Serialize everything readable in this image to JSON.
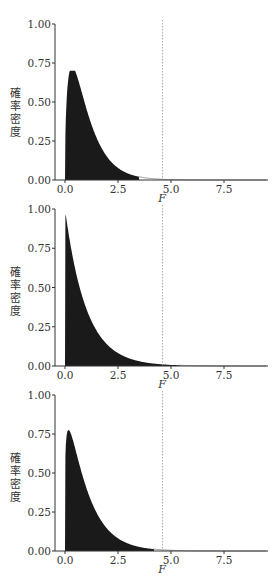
{
  "chart_data": [
    {
      "type": "area",
      "title": "",
      "xlabel": "F",
      "ylabel": "確率密度",
      "xlim": [
        0,
        9.5
      ],
      "ylim": [
        0,
        1.0
      ],
      "xticks": [
        "0.0",
        "2.5",
        "5.0",
        "7.5"
      ],
      "yticks": [
        "0.00",
        "0.25",
        "0.50",
        "0.75",
        "1.00"
      ],
      "grid": false,
      "critical_value_line": 4.6,
      "shaded_until": 3.5,
      "series": [
        {
          "name": "F density",
          "df1": 3,
          "df2": 1000,
          "peak": {
            "x": 0.27,
            "y": 0.7
          }
        }
      ]
    },
    {
      "type": "area",
      "title": "",
      "xlabel": "F",
      "ylabel": "確率密度",
      "xlim": [
        0,
        9.5
      ],
      "ylim": [
        0,
        1.0
      ],
      "xticks": [
        "0.0",
        "2.5",
        "5.0",
        "7.5"
      ],
      "yticks": [
        "0.00",
        "0.25",
        "0.50",
        "0.75",
        "1.00"
      ],
      "grid": false,
      "critical_value_line": 4.6,
      "shaded_until": 5.4,
      "series": [
        {
          "name": "F density",
          "df1": 2,
          "df2": 1000,
          "peak": {
            "x": 0.05,
            "y": 0.96
          }
        }
      ]
    },
    {
      "type": "area",
      "title": "",
      "xlabel": "F",
      "ylabel": "確率密度",
      "xlim": [
        0,
        9.5
      ],
      "ylim": [
        0,
        1.0
      ],
      "xticks": [
        "0.0",
        "2.5",
        "5.0",
        "7.5"
      ],
      "yticks": [
        "0.00",
        "0.25",
        "0.50",
        "0.75",
        "1.00"
      ],
      "grid": false,
      "critical_value_line": 4.6,
      "shaded_until": 4.2,
      "series": [
        {
          "name": "F density",
          "df1": 2.4,
          "df2": 1000,
          "peak": {
            "x": 0.1,
            "y": 0.8
          }
        }
      ]
    }
  ],
  "labels": {
    "ylabel_chars": [
      "確",
      "率",
      "密",
      "度"
    ],
    "xlabel": "F"
  },
  "colors": {
    "fill": "#1a1a1a",
    "axis": "#333333",
    "curve": "#777777",
    "critical_line": "#999999"
  }
}
